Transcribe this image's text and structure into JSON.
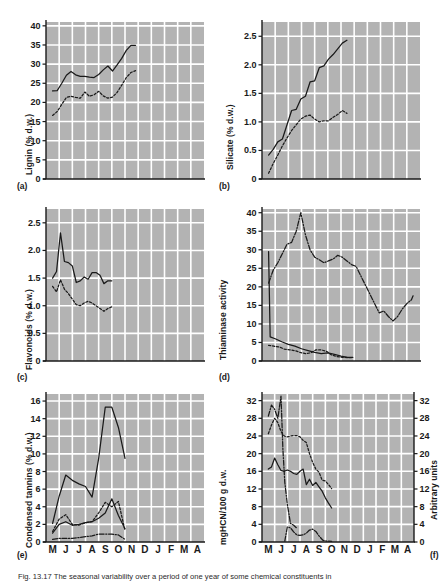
{
  "figure": {
    "background": "#ffffff",
    "plot_background": "#b3b3b3",
    "grid_color": "#ffffff",
    "line_color": "#1a1a1a",
    "caption": "Fig. 13.17 The seasonal variability over a period of one year of some chemical constituents in"
  },
  "xaxis": {
    "labels": [
      "M",
      "J",
      "J",
      "A",
      "S",
      "O",
      "N",
      "D",
      "J",
      "F",
      "M",
      "A"
    ]
  },
  "chart_data": [
    {
      "type": "line",
      "panel": "a",
      "panel_label": "(a)",
      "title": "",
      "ylabel": "Lignin (% d.w.)",
      "xlabel": "",
      "ylim": [
        0,
        41
      ],
      "yticks": [
        0,
        5,
        10,
        15,
        20,
        25,
        30,
        35,
        40
      ],
      "grid": true,
      "x": [
        "M",
        "J",
        "J",
        "A",
        "S",
        "O",
        "N",
        "D",
        "J",
        "F",
        "M",
        "A"
      ],
      "series": [
        {
          "name": "solid",
          "style": "solid",
          "x": [
            0.0,
            0.35,
            0.7,
            1.05,
            1.4,
            1.75,
            2.1,
            2.45,
            2.8,
            3.15,
            3.5,
            3.85,
            4.2,
            4.55,
            4.9,
            5.25,
            5.6,
            5.95,
            6.3
          ],
          "values": [
            23.0,
            23.1,
            25.0,
            27.1,
            28.1,
            27.2,
            26.8,
            26.8,
            26.6,
            26.5,
            27.3,
            28.5,
            29.5,
            28.2,
            29.8,
            31.5,
            33.6,
            34.9,
            34.9
          ]
        },
        {
          "name": "dotted",
          "style": "dotted",
          "x": [
            0.0,
            0.35,
            0.7,
            1.05,
            1.4,
            1.75,
            2.1,
            2.45,
            2.8,
            3.15,
            3.5,
            3.85,
            4.2,
            4.55,
            4.9,
            5.25,
            5.6,
            5.95,
            6.3
          ],
          "values": [
            16.6,
            17.6,
            19.5,
            21.3,
            21.6,
            21.3,
            21.1,
            22.7,
            21.6,
            22.0,
            22.9,
            21.7,
            21.1,
            21.4,
            22.6,
            24.5,
            26.5,
            27.8,
            28.3
          ]
        }
      ]
    },
    {
      "type": "line",
      "panel": "b",
      "panel_label": "(b)",
      "title": "",
      "ylabel": "Silicate (% d.w.)",
      "xlabel": "",
      "ylim": [
        0,
        2.75
      ],
      "yticks": [
        0,
        0.5,
        1.0,
        1.5,
        2.0,
        2.5
      ],
      "ytick_labels": [
        "0",
        "0.5",
        "1.0",
        "1.5",
        "2.0",
        "2.5"
      ],
      "grid": true,
      "x": [
        "M",
        "J",
        "J",
        "A",
        "S",
        "O",
        "N",
        "D",
        "J",
        "F",
        "M",
        "A"
      ],
      "series": [
        {
          "name": "solid",
          "style": "solid",
          "x": [
            0.0,
            0.35,
            0.7,
            1.05,
            1.4,
            1.75,
            2.1,
            2.45,
            2.8,
            3.15,
            3.5,
            3.85,
            4.2,
            4.55,
            4.9,
            5.25,
            5.6,
            5.95
          ],
          "values": [
            0.42,
            0.52,
            0.65,
            0.7,
            0.95,
            1.2,
            1.22,
            1.4,
            1.45,
            1.7,
            1.72,
            1.95,
            1.98,
            2.1,
            2.18,
            2.28,
            2.38,
            2.43
          ]
        },
        {
          "name": "dotted",
          "style": "dotted",
          "x": [
            0.0,
            0.35,
            0.7,
            1.05,
            1.4,
            1.75,
            2.1,
            2.45,
            2.8,
            3.15,
            3.5,
            3.85,
            4.2,
            4.55,
            4.9,
            5.25,
            5.6,
            5.95
          ],
          "values": [
            0.1,
            0.27,
            0.42,
            0.58,
            0.72,
            0.85,
            0.95,
            1.05,
            1.1,
            1.12,
            1.05,
            1.0,
            1.02,
            1.02,
            1.08,
            1.13,
            1.2,
            1.15
          ]
        }
      ]
    },
    {
      "type": "line",
      "panel": "c",
      "panel_label": "(c)",
      "title": "",
      "ylabel": "Flavonoids (% d.w.)",
      "xlabel": "",
      "ylim": [
        0,
        2.75
      ],
      "yticks": [
        0,
        0.5,
        1.0,
        1.5,
        2.0,
        2.5
      ],
      "ytick_labels": [
        "0",
        "0.5",
        "1.0",
        "1.5",
        "2.0",
        "2.5"
      ],
      "grid": true,
      "x": [
        "M",
        "J",
        "J",
        "A",
        "S",
        "O",
        "N",
        "D",
        "J",
        "F",
        "M",
        "A"
      ],
      "series": [
        {
          "name": "solid",
          "style": "solid",
          "x": [
            0.0,
            0.3,
            0.6,
            0.9,
            1.2,
            1.5,
            1.8,
            2.1,
            2.4,
            2.7,
            3.0,
            3.3,
            3.6,
            3.9,
            4.2,
            4.5
          ],
          "values": [
            1.5,
            1.62,
            2.32,
            1.8,
            1.78,
            1.72,
            1.42,
            1.45,
            1.52,
            1.48,
            1.6,
            1.6,
            1.55,
            1.4,
            1.45,
            1.45
          ]
        },
        {
          "name": "dotted",
          "style": "dotted",
          "x": [
            0.0,
            0.3,
            0.6,
            0.9,
            1.2,
            1.5,
            1.8,
            2.1,
            2.4,
            2.7,
            3.0,
            3.3,
            3.6,
            3.9,
            4.2,
            4.5
          ],
          "values": [
            1.35,
            1.25,
            1.47,
            1.3,
            1.22,
            1.12,
            1.02,
            1.0,
            1.05,
            1.08,
            1.05,
            1.0,
            0.95,
            0.9,
            0.95,
            0.98
          ]
        }
      ]
    },
    {
      "type": "line",
      "panel": "d",
      "panel_label": "(d)",
      "title": "",
      "ylabel": "Thiaminase activity",
      "xlabel": "",
      "ylim": [
        0,
        41
      ],
      "yticks": [
        0,
        5,
        10,
        15,
        20,
        25,
        30,
        35,
        40
      ],
      "grid": true,
      "x": [
        "M",
        "J",
        "J",
        "A",
        "S",
        "O",
        "N",
        "D",
        "J",
        "F",
        "M",
        "A"
      ],
      "series": [
        {
          "name": "dash-dot",
          "style": "dashdot",
          "x": [
            0.0,
            0.35,
            0.7,
            1.05,
            1.4,
            1.75,
            2.1,
            2.45,
            2.8,
            3.15,
            3.5,
            3.85,
            4.2,
            4.55,
            4.9,
            5.25,
            5.6,
            5.95,
            6.3,
            6.65,
            7.0,
            7.35,
            7.7,
            8.05,
            8.4,
            8.75,
            9.1,
            9.45,
            9.8,
            10.15,
            10.5,
            10.85,
            11.0
          ],
          "values": [
            21.0,
            24.5,
            26.5,
            29.0,
            31.5,
            32.0,
            35.0,
            40.0,
            34.0,
            30.0,
            28.0,
            27.3,
            26.5,
            27.0,
            27.5,
            28.5,
            28.0,
            27.0,
            26.0,
            25.5,
            23.0,
            20.5,
            18.0,
            15.5,
            13.0,
            13.5,
            12.0,
            10.8,
            12.0,
            14.0,
            15.5,
            16.5,
            17.8
          ]
        },
        {
          "name": "solid",
          "style": "solid",
          "x": [
            0.0,
            0.12,
            0.5,
            1.0,
            1.5,
            2.0,
            2.5,
            3.0,
            3.5,
            4.0,
            4.5,
            5.0,
            5.5,
            6.0,
            6.4
          ],
          "values": [
            29.5,
            6.5,
            6.0,
            5.2,
            4.5,
            4.0,
            3.3,
            2.8,
            2.3,
            2.0,
            2.2,
            1.8,
            1.3,
            1.0,
            1.0
          ]
        },
        {
          "name": "dotted",
          "style": "dotted",
          "x": [
            0.0,
            0.4,
            0.8,
            1.2,
            1.6,
            2.0,
            2.4,
            2.8,
            3.2,
            3.6,
            4.0,
            4.4,
            4.8,
            5.2,
            5.6,
            6.0,
            6.4
          ],
          "values": [
            4.2,
            4.0,
            3.8,
            3.2,
            3.0,
            2.8,
            2.3,
            2.0,
            2.2,
            3.0,
            3.0,
            2.6,
            1.6,
            1.2,
            1.0,
            0.9,
            0.9
          ]
        }
      ]
    },
    {
      "type": "line",
      "panel": "e",
      "panel_label": "(e)",
      "title": "",
      "ylabel": "Condensed tannins (% d.w.)",
      "xlabel": "",
      "ylim": [
        0,
        16.8
      ],
      "yticks": [
        0,
        2,
        4,
        6,
        8,
        10,
        12,
        14,
        16
      ],
      "grid": true,
      "x": [
        "M",
        "J",
        "J",
        "A",
        "S",
        "O",
        "N",
        "D",
        "J",
        "F",
        "M",
        "A"
      ],
      "series": [
        {
          "name": "solid",
          "style": "solid",
          "x": [
            0.0,
            0.5,
            1.0,
            1.5,
            2.0,
            2.5,
            3.0,
            3.5,
            4.0,
            4.5,
            5.0,
            5.5
          ],
          "values": [
            2.1,
            5.2,
            7.6,
            7.0,
            6.6,
            6.3,
            5.1,
            9.5,
            15.3,
            15.3,
            13.0,
            9.5
          ]
        },
        {
          "name": "dotted",
          "style": "dotted",
          "x": [
            0.0,
            0.5,
            1.0,
            1.5,
            2.0,
            2.5,
            3.0,
            3.5,
            4.0,
            4.5,
            5.0,
            5.5
          ],
          "values": [
            1.2,
            2.6,
            3.1,
            2.0,
            1.9,
            2.2,
            2.3,
            3.3,
            4.5,
            4.0,
            4.6,
            1.3
          ]
        },
        {
          "name": "dashdot",
          "style": "dashdot",
          "x": [
            0.0,
            0.5,
            1.0,
            1.5,
            2.0,
            2.5,
            3.0,
            3.5,
            4.0,
            4.5,
            5.0,
            5.5
          ],
          "values": [
            0.3,
            0.4,
            0.4,
            0.4,
            0.5,
            0.6,
            0.7,
            0.9,
            0.9,
            0.9,
            0.8,
            0.3
          ]
        },
        {
          "name": "solid2",
          "style": "solid",
          "x": [
            0.0,
            0.5,
            1.0,
            1.5,
            2.0,
            2.5,
            3.0,
            3.5,
            4.0,
            4.5,
            5.0,
            5.5
          ],
          "values": [
            1.0,
            2.0,
            2.3,
            1.9,
            2.0,
            2.2,
            2.3,
            2.7,
            3.3,
            4.9,
            3.0,
            1.5
          ]
        }
      ]
    },
    {
      "type": "line",
      "panel": "f",
      "panel_label": "(f)",
      "title": "",
      "ylabel": "mgHCN/100 g d.w.",
      "ylabel_right": "Arbitrary units",
      "xlabel": "",
      "ylim": [
        0,
        33.5
      ],
      "yticks": [
        0,
        4,
        8,
        12,
        16,
        20,
        24,
        28,
        32
      ],
      "ylim_right": [
        0,
        33.5
      ],
      "yticks_right": [
        0,
        4,
        8,
        12,
        16,
        20,
        24,
        28,
        32
      ],
      "grid": true,
      "x": [
        "M",
        "J",
        "J",
        "A",
        "S",
        "O",
        "N",
        "D",
        "J",
        "F",
        "M",
        "A"
      ],
      "series": [
        {
          "name": "dashdot",
          "style": "dashdot",
          "x": [
            0.0,
            0.25,
            0.5,
            0.75,
            1.0,
            1.15,
            1.3,
            1.5,
            1.75,
            2.0,
            2.3
          ],
          "values": [
            28.5,
            31.0,
            30.0,
            28.0,
            33.0,
            21.0,
            13.5,
            8.5,
            4.2,
            3.8,
            3.0
          ]
        },
        {
          "name": "dotted",
          "style": "dotted",
          "x": [
            0.0,
            0.25,
            0.5,
            0.75,
            1.0,
            1.25,
            1.5,
            1.75,
            2.0,
            2.25,
            2.5,
            2.75,
            3.0,
            3.25,
            3.5,
            3.75,
            4.0,
            4.25,
            4.5,
            4.75,
            5.0
          ],
          "values": [
            24.5,
            26.5,
            28.0,
            27.0,
            25.0,
            24.0,
            23.8,
            24.0,
            24.1,
            24.1,
            23.8,
            23.0,
            22.5,
            20.0,
            18.0,
            16.5,
            15.8,
            14.0,
            13.8,
            13.0,
            12.1
          ]
        },
        {
          "name": "solid",
          "style": "solid",
          "x": [
            0.0,
            0.25,
            0.5,
            0.75,
            1.0,
            1.25,
            1.5,
            1.75,
            2.0,
            2.25,
            2.5,
            2.75,
            3.0,
            3.25,
            3.5,
            3.75,
            4.0,
            4.25,
            4.5,
            4.75,
            5.0
          ],
          "values": [
            16.5,
            17.0,
            19.0,
            17.5,
            16.2,
            16.0,
            16.3,
            16.0,
            15.5,
            15.3,
            16.0,
            16.5,
            13.0,
            14.2,
            12.8,
            13.5,
            12.5,
            11.5,
            10.0,
            8.8,
            7.7
          ]
        },
        {
          "name": "dashdot2",
          "style": "dashdot",
          "x": [
            1.3,
            1.5,
            1.75,
            2.0,
            2.25,
            2.5,
            2.75,
            3.0,
            3.25,
            3.5,
            3.75,
            4.0,
            4.3,
            4.6,
            5.0
          ],
          "values": [
            0.2,
            3.4,
            3.2,
            2.3,
            1.6,
            1.5,
            1.6,
            2.0,
            2.7,
            2.9,
            2.4,
            1.4,
            0.4,
            0.2,
            0.15
          ]
        }
      ]
    }
  ]
}
